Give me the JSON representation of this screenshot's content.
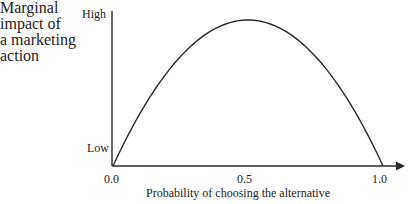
{
  "diagram": {
    "y_axis_label_lines": [
      "Marginal",
      "impact of",
      "a marketing",
      "action"
    ],
    "y_axis_high": "High",
    "y_axis_low": "Low",
    "x_axis_label": "Probability of choosing the alternative",
    "x_ticks": [
      "0.0",
      "0.5",
      "1.0"
    ],
    "curve": "inverted-U (parabola) peaking at probability 0.5",
    "colors": {
      "line": "#2a2a2a",
      "text": "#222222",
      "background": "#ffffff"
    }
  },
  "chart_data": {
    "type": "line",
    "title": "",
    "xlabel": "Probability of choosing the alternative",
    "ylabel": "Marginal impact of a marketing action",
    "x": [
      0.0,
      0.1,
      0.2,
      0.3,
      0.4,
      0.5,
      0.6,
      0.7,
      0.8,
      0.9,
      1.0
    ],
    "series": [
      {
        "name": "Marginal impact",
        "values": [
          0.0,
          0.36,
          0.64,
          0.84,
          0.96,
          1.0,
          0.96,
          0.84,
          0.64,
          0.36,
          0.0
        ]
      }
    ],
    "xlim": [
      0.0,
      1.0
    ],
    "ylim": [
      "Low",
      "High"
    ],
    "x_tick_labels": [
      "0.0",
      "0.5",
      "1.0"
    ],
    "y_tick_labels": [
      "Low",
      "High"
    ],
    "grid": false,
    "legend": "none"
  }
}
